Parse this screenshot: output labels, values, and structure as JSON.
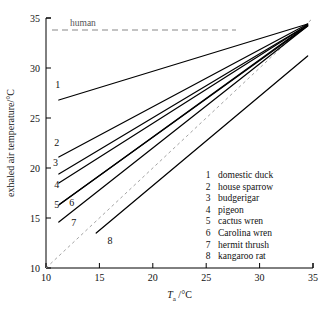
{
  "chart_data": {
    "type": "line",
    "title": "",
    "xlabel": "Ta /°C",
    "ylabel": "exhaled air temperature/°C",
    "xlim": [
      10,
      35
    ],
    "ylim": [
      10,
      35
    ],
    "xticks": [
      10,
      15,
      20,
      25,
      30,
      35
    ],
    "yticks": [
      10,
      15,
      20,
      25,
      30,
      35
    ],
    "grid": false,
    "legend_position": "inside-lower-right",
    "annotations": [
      {
        "name": "human",
        "label": "human",
        "type": "horizontal-dashed-line",
        "y": 33.8
      }
    ],
    "reference_lines": [
      {
        "name": "identity",
        "label": "",
        "type": "dashed-diagonal",
        "from": [
          10,
          10
        ],
        "to": [
          35,
          35
        ]
      }
    ],
    "series": [
      {
        "name": "domestic duck",
        "number": "1",
        "x": [
          11.2,
          34.5
        ],
        "y": [
          26.8,
          34.4
        ]
      },
      {
        "name": "house sparrow",
        "number": "2",
        "x": [
          11.2,
          34.5
        ],
        "y": [
          21.1,
          34.4
        ]
      },
      {
        "name": "budgerigar",
        "number": "3",
        "x": [
          11.2,
          34.5
        ],
        "y": [
          19.4,
          34.3
        ]
      },
      {
        "name": "pigeon",
        "number": "4",
        "x": [
          11.2,
          34.5
        ],
        "y": [
          18.5,
          34.3
        ]
      },
      {
        "name": "cactus wren",
        "number": "5",
        "x": [
          11.2,
          34.5
        ],
        "y": [
          16.3,
          34.3
        ]
      },
      {
        "name": "Carolina wren",
        "number": "6",
        "x": [
          11.3,
          34.5
        ],
        "y": [
          16.4,
          34.2
        ]
      },
      {
        "name": "hermit thrush",
        "number": "7",
        "x": [
          11.2,
          34.5
        ],
        "y": [
          14.6,
          34.2
        ]
      },
      {
        "name": "kangaroo rat",
        "number": "8",
        "x": [
          14.7,
          34.5
        ],
        "y": [
          13.5,
          31.2
        ]
      }
    ],
    "curve_labels": [
      {
        "number": "1",
        "x": 11.1,
        "y": 28.0
      },
      {
        "number": "2",
        "x": 11.0,
        "y": 22.2
      },
      {
        "number": "3",
        "x": 10.9,
        "y": 20.2
      },
      {
        "number": "4",
        "x": 11.0,
        "y": 18.0
      },
      {
        "number": "5",
        "x": 11.0,
        "y": 16.0
      },
      {
        "number": "6",
        "x": 12.4,
        "y": 16.2
      },
      {
        "number": "7",
        "x": 12.6,
        "y": 14.2
      },
      {
        "number": "8",
        "x": 16.0,
        "y": 12.4
      }
    ]
  },
  "legend": {
    "entries": [
      {
        "num": "1",
        "label": "domestic duck"
      },
      {
        "num": "2",
        "label": "house sparrow"
      },
      {
        "num": "3",
        "label": "budgerigar"
      },
      {
        "num": "4",
        "label": "pigeon"
      },
      {
        "num": "5",
        "label": "cactus wren"
      },
      {
        "num": "6",
        "label": "Carolina wren"
      },
      {
        "num": "7",
        "label": "hermit thrush"
      },
      {
        "num": "8",
        "label": "kangaroo rat"
      }
    ]
  },
  "axes": {
    "y_title": "exhaled air temperature/°C",
    "x_title_symbol": "T",
    "x_title_sub": "a",
    "x_title_unit": "/°C",
    "x_tick_labels": [
      "10",
      "15",
      "20",
      "25",
      "30",
      "35"
    ],
    "y_tick_labels": [
      "10",
      "15",
      "20",
      "25",
      "30",
      "35"
    ]
  },
  "colors": {
    "curve": "#000000",
    "identity": "#999999",
    "human": "#888888",
    "text": "#111111"
  }
}
